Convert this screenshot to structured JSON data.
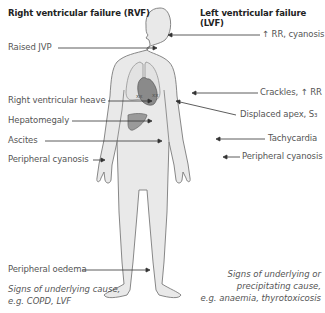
{
  "headers": {
    "left": "Right ventricular failure (RVF)",
    "right": "Left ventricular failure (LVF)"
  },
  "left_labels": [
    {
      "text": "Raised JVP"
    },
    {
      "text": "Right ventricular heave"
    },
    {
      "text": "Hepatomegaly"
    },
    {
      "text": "Ascites"
    },
    {
      "text": "Peripheral cyanosis"
    },
    {
      "text": "Peripheral oedema"
    }
  ],
  "right_labels": [
    {
      "text": "↑ RR, cyanosis"
    },
    {
      "text": "Crackles, ↑ RR"
    },
    {
      "text": "Displaced apex, S₃"
    },
    {
      "text": "Tachycardia"
    },
    {
      "text": "Peripheral cyanosis"
    }
  ],
  "notes": {
    "left_line1": "Signs of underlying cause,",
    "left_line2": "e.g. COPD, LVF",
    "right_line1": "Signs of underlying or",
    "right_line2": "precipitating cause,",
    "right_line3": "e.g. anaemia, thyrotoxicosis"
  },
  "markers": {
    "crackles": "xx"
  },
  "colors": {
    "body_fill": "#e8e8e8",
    "outline": "#777777",
    "organ": "#999999",
    "heart": "#888888"
  }
}
